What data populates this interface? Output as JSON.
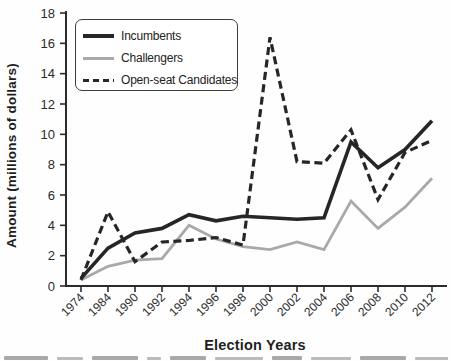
{
  "chart_data": {
    "type": "line",
    "title": "",
    "xlabel": "Election Years",
    "ylabel": "Amount (millions of dollars)",
    "categories": [
      "1974",
      "1984",
      "1990",
      "1992",
      "1994",
      "1996",
      "1998",
      "2000",
      "2002",
      "2004",
      "2006",
      "2008",
      "2010",
      "2012"
    ],
    "ylim": [
      0,
      18
    ],
    "ytick_step": 2,
    "grid": false,
    "legend_position": "top-left",
    "axis_color": "#2b2b2b",
    "series": [
      {
        "name": "Incumbents",
        "line_style": "solid",
        "color": "#262626",
        "stroke_width": 3.6,
        "values": [
          0.5,
          2.5,
          3.5,
          3.8,
          4.7,
          4.3,
          4.6,
          4.5,
          4.4,
          4.5,
          9.5,
          7.8,
          9.0,
          10.9
        ]
      },
      {
        "name": "Challengers",
        "line_style": "solid",
        "color": "#a9a9a9",
        "stroke_width": 2.8,
        "values": [
          0.4,
          1.3,
          1.7,
          1.8,
          4.0,
          3.1,
          2.6,
          2.4,
          2.9,
          2.4,
          5.6,
          3.8,
          5.2,
          7.1
        ]
      },
      {
        "name": "Open-seat Candidates",
        "line_style": "dashed",
        "color": "#262626",
        "stroke_width": 3.2,
        "values": [
          0.4,
          4.9,
          1.6,
          2.9,
          3.0,
          3.2,
          2.7,
          16.4,
          8.2,
          8.1,
          10.3,
          5.7,
          8.8,
          9.6
        ]
      }
    ]
  }
}
